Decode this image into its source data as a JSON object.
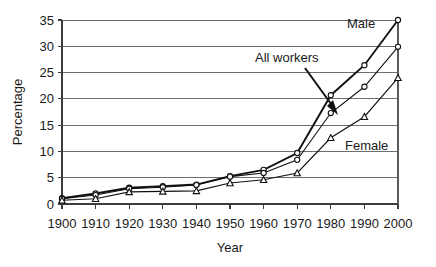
{
  "chart_data": {
    "type": "line",
    "title": "",
    "xlabel": "Year",
    "ylabel": "Percentage",
    "x": [
      1900,
      1910,
      1920,
      1930,
      1940,
      1950,
      1960,
      1970,
      1980,
      1990,
      2000
    ],
    "xticklabels": [
      "1900",
      "1910",
      "1920",
      "1930",
      "1940",
      "1950",
      "1960",
      "1970",
      "1980",
      "1990",
      "2000"
    ],
    "yticklabels": [
      "0",
      "5",
      "10",
      "15",
      "20",
      "25",
      "30",
      "35"
    ],
    "ylim": [
      0,
      35
    ],
    "xlim": [
      1900,
      2000
    ],
    "ytick_step": 5,
    "grid": "horizontal",
    "legend_position": "inline-annotations",
    "series": [
      {
        "name": "Male",
        "marker": "circle",
        "values": [
          1.1,
          2.0,
          3.1,
          3.4,
          3.7,
          5.3,
          6.5,
          9.7,
          20.7,
          26.4,
          35.0
        ],
        "annotation": "Male"
      },
      {
        "name": "All workers",
        "marker": "circle",
        "values": [
          1.0,
          1.7,
          2.9,
          3.2,
          3.6,
          5.2,
          5.9,
          8.4,
          17.3,
          22.3,
          29.9
        ],
        "annotation": "All workers"
      },
      {
        "name": "Female",
        "marker": "triangle",
        "values": [
          0.7,
          1.0,
          2.3,
          2.4,
          2.5,
          4.0,
          4.6,
          5.9,
          12.6,
          16.6,
          24.0
        ],
        "annotation": "Female"
      }
    ],
    "annotations": [
      {
        "text": "Male",
        "series": "Male"
      },
      {
        "text": "All workers",
        "series": "All workers",
        "has_arrow": true
      },
      {
        "text": "Female",
        "series": "Female"
      }
    ]
  },
  "colors": {
    "line": "#111111",
    "grid": "#6e6e6e",
    "text": "#1a1a1a",
    "background": "#ffffff"
  }
}
